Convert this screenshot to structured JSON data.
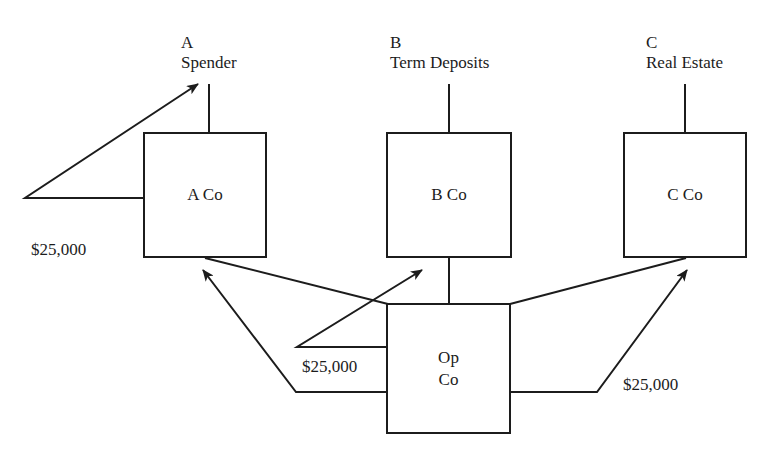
{
  "diagram": {
    "title": "",
    "top_entities": [
      {
        "letter": "A",
        "role": "Spender"
      },
      {
        "letter": "B",
        "role": "Term Deposits"
      },
      {
        "letter": "C",
        "role": "Real Estate"
      }
    ],
    "companies": [
      {
        "id": "a-co",
        "label": "A Co"
      },
      {
        "id": "b-co",
        "label": "B Co"
      },
      {
        "id": "c-co",
        "label": "C Co"
      }
    ],
    "operating_company": {
      "line1": "Op",
      "line2": "Co"
    },
    "flows": [
      {
        "from": "A Co",
        "to": "A Spender",
        "amount": "$25,000"
      },
      {
        "from": "Op Co",
        "to": "B Co",
        "amount": "$25,000"
      },
      {
        "from": "Op Co",
        "to": "A Co",
        "amount": ""
      },
      {
        "from": "Op Co",
        "to": "C Co",
        "amount": "$25,000"
      }
    ],
    "amounts": {
      "left": "$25,000",
      "center": "$25,000",
      "right": "$25,000"
    },
    "colors": {
      "ink": "#1c1c1c",
      "background": "#ffffff"
    }
  }
}
